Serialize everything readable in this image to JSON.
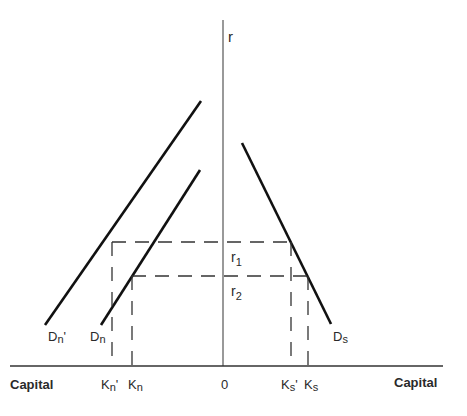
{
  "axes": {
    "y_label": "r",
    "x_label_left": "Capital",
    "x_label_right": "Capital",
    "origin_label": "0"
  },
  "rates": [
    {
      "label_main": "r",
      "label_sub": "1"
    },
    {
      "label_main": "r",
      "label_sub": "2"
    }
  ],
  "curves": [
    {
      "label_main": "D",
      "label_sub": "n",
      "label_suffix": "'"
    },
    {
      "label_main": "D",
      "label_sub": "n",
      "label_suffix": ""
    },
    {
      "label_main": "D",
      "label_sub": "s",
      "label_suffix": ""
    }
  ],
  "x_ticks": [
    {
      "label_main": "K",
      "label_sub": "n",
      "label_suffix": "'"
    },
    {
      "label_main": "K",
      "label_sub": "n",
      "label_suffix": ""
    },
    {
      "label_main": "K",
      "label_sub": "s",
      "label_suffix": "'"
    },
    {
      "label_main": "K",
      "label_sub": "s",
      "label_suffix": ""
    }
  ]
}
